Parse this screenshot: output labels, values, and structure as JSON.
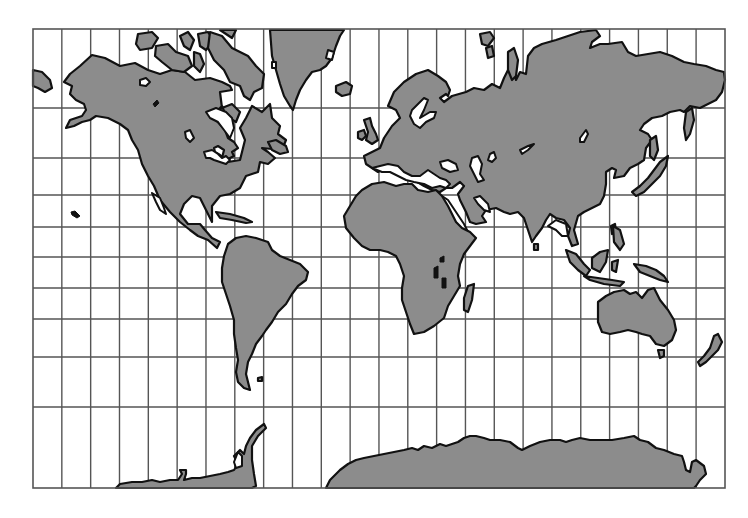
{
  "map": {
    "projection": "Mercator world map",
    "colors": {
      "land": "#8c8c8c",
      "water": "#ffffff",
      "coastline": "#111111",
      "graticule": "#555555"
    },
    "frame": {
      "left": 33,
      "top": 29,
      "right": 725,
      "bottom": 488
    },
    "graticule": {
      "meridian_count": 23,
      "meridian_spacing_px": 28.83,
      "parallels_y": [
        108,
        158,
        195,
        227,
        257,
        288,
        319,
        357,
        407
      ]
    },
    "landmasses": [
      "North America",
      "Greenland",
      "South America",
      "Europe",
      "Asia",
      "Africa",
      "Australia",
      "Antarctica",
      "Madagascar",
      "Japan",
      "New Zealand",
      "Indonesia",
      "British Isles",
      "Iceland"
    ]
  }
}
